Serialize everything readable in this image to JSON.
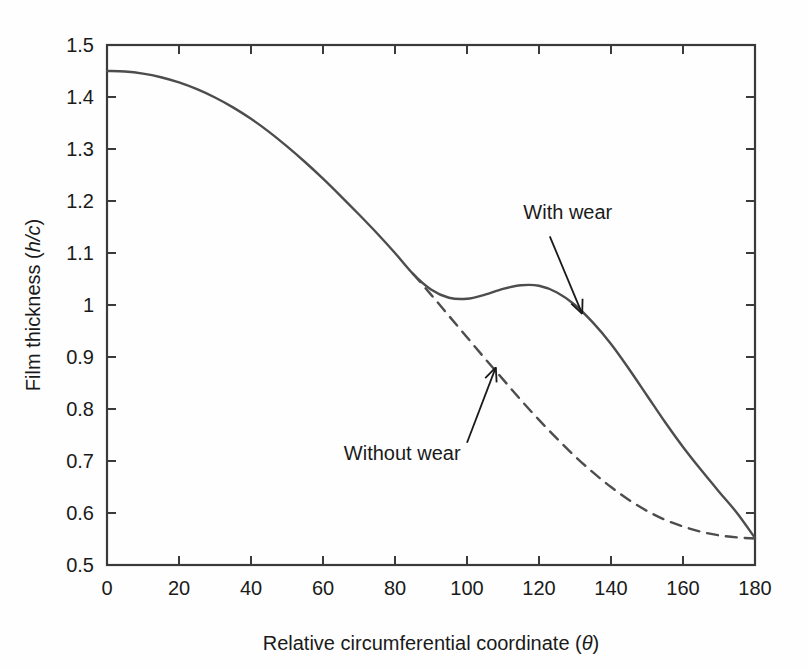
{
  "chart_data": {
    "type": "line",
    "title": "",
    "xlabel": "Relative circumferential coordinate (θ)",
    "xlabel_main": "Relative circumferential coordinate (",
    "xlabel_symbol": "θ",
    "xlabel_close": ")",
    "ylabel": "Film thickness (h/c)",
    "ylabel_main": "Film thickness (",
    "ylabel_symbol": "h/c",
    "ylabel_close": ")",
    "xlim": [
      0,
      180
    ],
    "ylim": [
      0.5,
      1.5
    ],
    "grid": false,
    "legend_position": "inline-annotations",
    "xticks": [
      0,
      20,
      40,
      60,
      80,
      100,
      120,
      140,
      160,
      180
    ],
    "xtick_labels": [
      "0",
      "20",
      "40",
      "60",
      "80",
      "100",
      "120",
      "140",
      "160",
      "180"
    ],
    "yticks": [
      0.5,
      0.6,
      0.7,
      0.8,
      0.9,
      1.0,
      1.1,
      1.2,
      1.3,
      1.4,
      1.5
    ],
    "ytick_labels": [
      "0.5",
      "0.6",
      "0.7",
      "0.8",
      "0.9",
      "1",
      "1.1",
      "1.2",
      "1.3",
      "1.4",
      "1.5"
    ],
    "line_color": "#4d4d4d",
    "axis_color": "#3a3a3a",
    "series": [
      {
        "name": "With wear",
        "style": "solid",
        "x": [
          0,
          5,
          10,
          15,
          20,
          25,
          30,
          35,
          40,
          45,
          50,
          55,
          60,
          65,
          70,
          75,
          80,
          85,
          90,
          95,
          100,
          105,
          110,
          115,
          120,
          125,
          130,
          135,
          140,
          145,
          150,
          155,
          160,
          165,
          170,
          175,
          180
        ],
        "y": [
          1.45,
          1.449,
          1.445,
          1.438,
          1.428,
          1.415,
          1.399,
          1.38,
          1.358,
          1.333,
          1.305,
          1.275,
          1.243,
          1.209,
          1.174,
          1.138,
          1.1,
          1.06,
          1.03,
          1.014,
          1.012,
          1.02,
          1.031,
          1.038,
          1.037,
          1.024,
          1.0,
          0.966,
          0.925,
          0.877,
          0.826,
          0.775,
          0.727,
          0.683,
          0.641,
          0.6,
          0.552
        ]
      },
      {
        "name": "Without wear",
        "style": "dashed",
        "x": [
          85,
          90,
          95,
          100,
          105,
          110,
          115,
          120,
          125,
          130,
          135,
          140,
          145,
          150,
          155,
          160,
          165,
          170,
          175,
          180
        ],
        "y": [
          1.06,
          1.02,
          0.979,
          0.938,
          0.897,
          0.857,
          0.817,
          0.779,
          0.743,
          0.709,
          0.678,
          0.65,
          0.625,
          0.604,
          0.587,
          0.574,
          0.564,
          0.557,
          0.553,
          0.551
        ]
      }
    ],
    "annotations": [
      {
        "text": "With wear",
        "text_x": 128,
        "text_y": 1.165,
        "arrow_from_x": 123,
        "arrow_from_y": 1.132,
        "arrow_to_x": 132,
        "arrow_to_y": 0.983
      },
      {
        "text": "Without wear",
        "text_x": 82,
        "text_y": 0.702,
        "arrow_from_x": 100,
        "arrow_from_y": 0.735,
        "arrow_to_x": 108,
        "arrow_to_y": 0.88
      }
    ]
  }
}
